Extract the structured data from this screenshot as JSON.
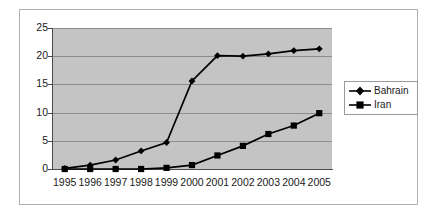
{
  "chart_data": {
    "type": "line",
    "title": "",
    "xlabel": "",
    "ylabel": "",
    "categories": [
      "1995",
      "1996",
      "1997",
      "1998",
      "1999",
      "2000",
      "2001",
      "2002",
      "2003",
      "2004",
      "2005"
    ],
    "series": [
      {
        "name": "Bahrain",
        "marker": "diamond",
        "color": "#000000",
        "values": [
          0.1,
          0.7,
          1.6,
          3.2,
          4.7,
          15.6,
          20.1,
          20.0,
          20.4,
          21.0,
          21.3
        ]
      },
      {
        "name": "Iran",
        "marker": "square",
        "color": "#000000",
        "values": [
          0.0,
          0.0,
          0.0,
          0.0,
          0.2,
          0.7,
          2.4,
          4.1,
          6.2,
          7.7,
          9.9
        ]
      }
    ],
    "ylim": [
      0,
      25
    ],
    "y_ticks": [
      "0",
      "5",
      "10",
      "15",
      "20",
      "25"
    ],
    "grid": true,
    "legend_position": "right",
    "plot_background": "#c4c4c4",
    "gridline_color": "#8d8d8d",
    "axis_color": "#4a4a4a",
    "frame_color": "#b0b0b0"
  },
  "legend": {
    "entries": [
      {
        "label": "Bahrain",
        "marker": "diamond"
      },
      {
        "label": "Iran",
        "marker": "square"
      }
    ]
  }
}
